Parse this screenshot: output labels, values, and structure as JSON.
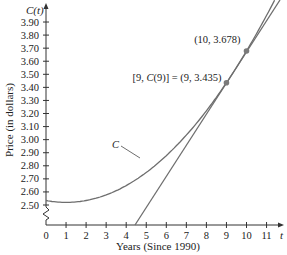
{
  "chart_data": {
    "type": "line",
    "title": "",
    "xlabel": "Years (Since 1990)",
    "ylabel": "Price (in dollars)",
    "x_axis_var": "t",
    "y_axis_var": "C(t)",
    "x_ticks": [
      "0",
      "1",
      "2",
      "3",
      "4",
      "5",
      "6",
      "7",
      "8",
      "9",
      "10",
      "11"
    ],
    "y_ticks": [
      "2.50",
      "2.60",
      "2.70",
      "2.80",
      "2.90",
      "3.00",
      "3.10",
      "3.20",
      "3.30",
      "3.40",
      "3.50",
      "3.60",
      "3.70",
      "3.80",
      "3.90"
    ],
    "xlim": [
      0,
      11.5
    ],
    "ylim": [
      2.5,
      4.0
    ],
    "y_axis_break": true,
    "grid": false,
    "series": [
      {
        "name": "C",
        "kind": "curve",
        "x": [
          0,
          1,
          2,
          3,
          4,
          5,
          6,
          7,
          8,
          9,
          10,
          11,
          11.4
        ],
        "values": [
          2.534,
          2.52,
          2.534,
          2.577,
          2.649,
          2.749,
          2.878,
          3.035,
          3.221,
          3.435,
          3.678,
          3.95,
          4.067
        ]
      },
      {
        "name": "tangent at t=9",
        "kind": "line",
        "x": [
          4.45,
          11.7
        ],
        "values": [
          2.42,
          4.07
        ]
      }
    ],
    "annotations": [
      {
        "text": "(10, 3.678)",
        "x": 10,
        "y": 3.678,
        "marker": true
      },
      {
        "text": "[9, C(9)] = (9, 3.435)",
        "x": 9,
        "y": 3.435,
        "marker": true
      },
      {
        "text": "C",
        "label_for": "curve C",
        "x": 5.3,
        "y": 3.05
      }
    ]
  },
  "labels": {
    "y_var": "C(t)",
    "x_var": "t",
    "xlabel": "Years (Since 1990)",
    "ylabel": "Price (in dollars)",
    "point10": "(10, 3.678)",
    "point9": "[9, C(9)] = (9, 3.435)",
    "curve_name": "C"
  },
  "colors": {
    "curve": "#6e6e6e",
    "axis": "#333333",
    "point": "#7a7a7a",
    "text": "#222222"
  }
}
